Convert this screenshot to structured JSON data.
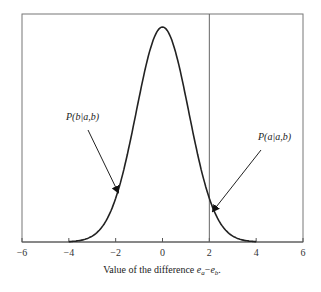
{
  "chart_data": {
    "type": "line",
    "title": "",
    "xlabel": "Value of the difference e_a−e_b.",
    "xlabel_parts": {
      "prefix": "Value of the difference ",
      "var1": "e",
      "sub1": "a",
      "minus": "−",
      "var2": "e",
      "sub2": "b",
      "suffix": "."
    },
    "ylabel": "",
    "xlim": [
      -6,
      6
    ],
    "x_ticks": [
      -6,
      -4,
      -2,
      0,
      2,
      4,
      6
    ],
    "x_tick_labels": [
      "−6",
      "−4",
      "−2",
      "0",
      "2",
      "4",
      "6"
    ],
    "y_ticks": [],
    "grid": false,
    "series": [
      {
        "name": "density of e_a − e_b",
        "shape": "bell-shaped (normal), mean 0, relative height",
        "x": [
          -4,
          -3.5,
          -3,
          -2.5,
          -2,
          -1.5,
          -1,
          -0.5,
          0,
          0.5,
          1,
          1.5,
          2,
          2.5,
          3,
          3.5,
          4
        ],
        "y": [
          0.02,
          0.04,
          0.09,
          0.18,
          0.32,
          0.51,
          0.72,
          0.92,
          1.0,
          0.92,
          0.72,
          0.51,
          0.32,
          0.18,
          0.09,
          0.04,
          0.02
        ]
      }
    ],
    "vertical_line": {
      "x": 2
    },
    "annotations": [
      {
        "text": "P(b|a,b)",
        "arrow_to_x": -2,
        "side": "left"
      },
      {
        "text": "P(a|a,b)",
        "arrow_to_x": 2,
        "side": "right"
      }
    ]
  }
}
